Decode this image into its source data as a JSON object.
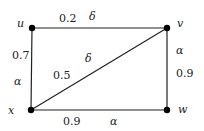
{
  "graph": {
    "nodes": [
      {
        "id": "u",
        "label": "u"
      },
      {
        "id": "v",
        "label": "v"
      },
      {
        "id": "x",
        "label": "x"
      },
      {
        "id": "w",
        "label": "w"
      }
    ],
    "edges": [
      {
        "from": "u",
        "to": "v",
        "weight": "0.2",
        "symbol": "δ"
      },
      {
        "from": "u",
        "to": "x",
        "weight": "0.7",
        "symbol": "α"
      },
      {
        "from": "x",
        "to": "v",
        "weight": "0.5",
        "symbol": "δ"
      },
      {
        "from": "v",
        "to": "w",
        "weight": "0.9",
        "symbol": "α"
      },
      {
        "from": "x",
        "to": "w",
        "weight": "0.9",
        "symbol": "α"
      }
    ]
  }
}
